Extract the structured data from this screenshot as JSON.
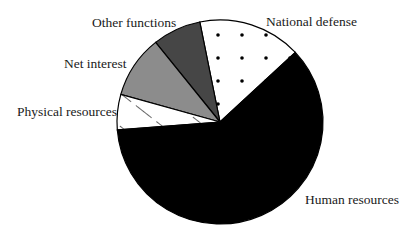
{
  "chart_data": {
    "type": "pie",
    "title": "",
    "center": [
      220,
      122
    ],
    "radius": 102,
    "start_angle_deg": 43,
    "direction": "counterclockwise",
    "slices": [
      {
        "label": "National defense",
        "value": 16.2,
        "fill": "#ffffff",
        "pattern": "dots"
      },
      {
        "label": "Other functions",
        "value": 7.6,
        "fill": "#464646",
        "pattern": "solid"
      },
      {
        "label": "Net interest",
        "value": 9.9,
        "fill": "#8c8c8c",
        "pattern": "solid"
      },
      {
        "label": "Physical resources",
        "value": 5.6,
        "fill": "#ffffff",
        "pattern": "hatch"
      },
      {
        "label": "Human resources",
        "value": 60.7,
        "fill": "#000000",
        "pattern": "solid"
      }
    ],
    "legend": "none (direct labels)",
    "units": "percent of total"
  },
  "labels": {
    "national_defense": "National defense",
    "other_functions": "Other functions",
    "net_interest": "Net interest",
    "physical_resources": "Physical resources",
    "human_resources": "Human resources"
  }
}
